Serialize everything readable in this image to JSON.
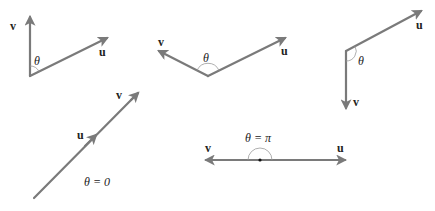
{
  "figure": {
    "colors": {
      "vector": "#7a7a7a",
      "arc": "#9a9a9a",
      "text": "#222222"
    },
    "panels": [
      {
        "id": "acute",
        "u_label": "u",
        "v_label": "v",
        "angle_label": "θ"
      },
      {
        "id": "obtuse",
        "u_label": "u",
        "v_label": "v",
        "angle_label": "θ"
      },
      {
        "id": "large-obtuse",
        "u_label": "u",
        "v_label": "v",
        "angle_label": "θ"
      },
      {
        "id": "parallel",
        "u_label": "u",
        "v_label": "v",
        "angle_label": "θ = 0"
      },
      {
        "id": "antiparallel",
        "u_label": "u",
        "v_label": "v",
        "angle_label": "θ = π"
      }
    ]
  }
}
